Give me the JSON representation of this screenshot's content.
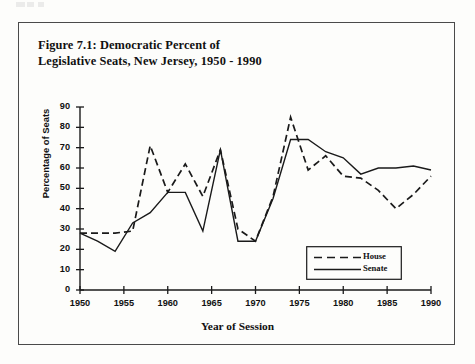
{
  "figure": {
    "title_line1": "Figure 7.1: Democratic Percent of",
    "title_line2": "Legislative Seats, New Jersey, 1950 - 1990"
  },
  "chart_data": {
    "type": "line",
    "title": "Figure 7.1: Democratic Percent of Legislative Seats, New Jersey, 1950 - 1990",
    "xlabel": "Year of Session",
    "ylabel": "Percentage of Seats",
    "xlim": [
      1950,
      1990
    ],
    "ylim": [
      0,
      90
    ],
    "xticks": [
      1950,
      1955,
      1960,
      1965,
      1970,
      1975,
      1980,
      1985,
      1990
    ],
    "yticks": [
      0,
      10,
      20,
      30,
      40,
      50,
      60,
      70,
      80,
      90
    ],
    "xtick_labels": [
      "1950",
      "1955",
      "1960",
      "1965",
      "1970",
      "1975",
      "1980",
      "1985",
      "1990"
    ],
    "ytick_labels": [
      "0",
      "10",
      "20",
      "30",
      "40",
      "50",
      "60",
      "70",
      "80",
      "90"
    ],
    "grid": false,
    "legend_position": "lower right",
    "x": [
      1950,
      1952,
      1954,
      1956,
      1958,
      1960,
      1962,
      1964,
      1966,
      1968,
      1970,
      1972,
      1974,
      1976,
      1978,
      1980,
      1982,
      1984,
      1986,
      1988,
      1990
    ],
    "series": [
      {
        "name": "House",
        "style": "dashed",
        "color": "#1a1a1a",
        "values": [
          28,
          28,
          28,
          29,
          71,
          48,
          62,
          46,
          69,
          30,
          24,
          46,
          85,
          59,
          66,
          56,
          55,
          49,
          40,
          47,
          56
        ]
      },
      {
        "name": "Senate",
        "style": "solid",
        "color": "#1a1a1a",
        "values": [
          28,
          24,
          19,
          33,
          38,
          48,
          48,
          29,
          69,
          24,
          24,
          45,
          74,
          74,
          68,
          65,
          57,
          60,
          60,
          61,
          59
        ]
      }
    ]
  },
  "legend": {
    "items": [
      {
        "label": "House",
        "style": "dashed"
      },
      {
        "label": "Senate",
        "style": "solid"
      }
    ]
  }
}
